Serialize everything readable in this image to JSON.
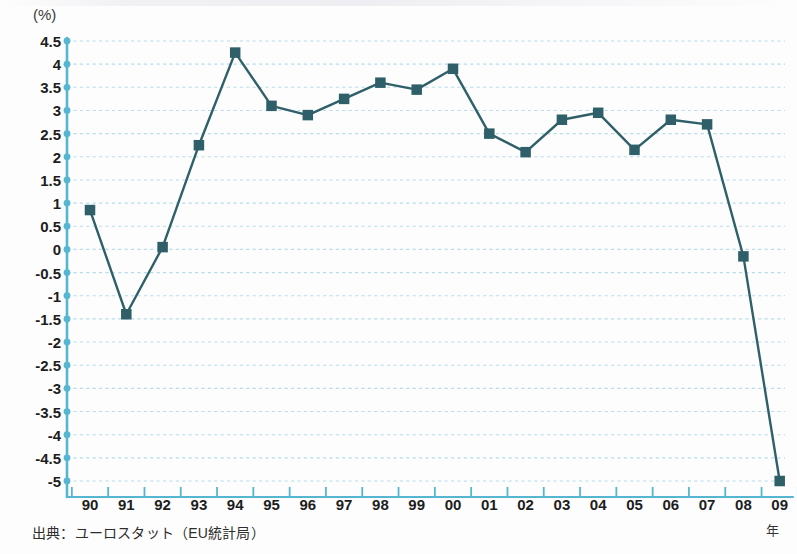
{
  "figure": {
    "y_unit_label": "(%)",
    "x_unit_label": "年",
    "source_note": "出典：ユーロスタット（EU統計局）"
  },
  "chart_data": {
    "type": "line",
    "title": "",
    "subtitle": "",
    "xlabel": "年",
    "ylabel": "(%)",
    "ylim": [
      -5,
      4.5
    ],
    "xlim": [
      "90",
      "09"
    ],
    "grid": true,
    "legend": false,
    "marker": "square",
    "series_color": "#2f6069",
    "axis_color": "#56b6d2",
    "grid_color": "#b7dcea",
    "categories": [
      "90",
      "91",
      "92",
      "93",
      "94",
      "95",
      "96",
      "97",
      "98",
      "99",
      "00",
      "01",
      "02",
      "03",
      "04",
      "05",
      "06",
      "07",
      "08",
      "09"
    ],
    "y_ticks": [
      "4.5",
      "4",
      "3.5",
      "3",
      "2.5",
      "2",
      "1.5",
      "1",
      "0.5",
      "0",
      "-0.5",
      "-1",
      "-1.5",
      "-2",
      "-2.5",
      "-3",
      "-3.5",
      "-4",
      "-4.5",
      "-5"
    ],
    "series": [
      {
        "name": "",
        "values": [
          0.85,
          -1.4,
          0.05,
          2.25,
          4.25,
          3.1,
          2.9,
          3.25,
          3.6,
          3.45,
          3.9,
          2.5,
          2.1,
          2.8,
          2.95,
          2.15,
          2.8,
          2.7,
          -0.15,
          -5.0
        ]
      }
    ]
  }
}
